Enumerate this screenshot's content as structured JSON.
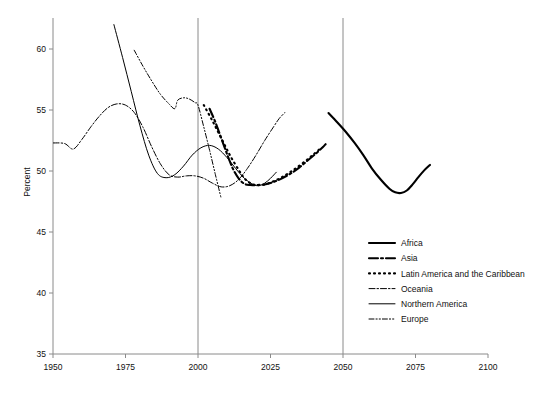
{
  "chart_data": {
    "type": "line",
    "title": "",
    "subtitle": "",
    "xlabel": "",
    "ylabel": "Percent",
    "xlim": [
      1950,
      2100
    ],
    "ylim": [
      35,
      62
    ],
    "grid": false,
    "legend_position": "inside-bottom-right",
    "x_ticks": [
      1950,
      1975,
      2000,
      2025,
      2050,
      2075,
      2100
    ],
    "y_ticks": [
      35,
      40,
      45,
      50,
      55,
      60
    ],
    "reference_lines": [
      {
        "name": "year-2000-line",
        "x": 2000
      },
      {
        "name": "year-2050-line",
        "x": 2050
      }
    ],
    "annotations": [],
    "series": [
      {
        "name": "Africa",
        "style": "thick-solid",
        "stroke_width": 2.1,
        "dash": "none",
        "color": "#000000",
        "points": [
          [
            2045,
            54.75
          ],
          [
            2048,
            54.0
          ],
          [
            2051,
            53.2
          ],
          [
            2054,
            52.3
          ],
          [
            2057,
            51.3
          ],
          [
            2060,
            50.2
          ],
          [
            2063,
            49.3
          ],
          [
            2066,
            48.55
          ],
          [
            2068,
            48.25
          ],
          [
            2070,
            48.2
          ],
          [
            2072,
            48.4
          ],
          [
            2074,
            48.9
          ],
          [
            2076,
            49.5
          ],
          [
            2078,
            50.05
          ],
          [
            2080,
            50.5
          ]
        ]
      },
      {
        "name": "Asia",
        "style": "thick-dash-dot",
        "stroke_width": 2.1,
        "dash": "9 3 2 3",
        "color": "#000000",
        "points": [
          [
            2004,
            55.1
          ],
          [
            2006,
            54.0
          ],
          [
            2008,
            52.7
          ],
          [
            2010,
            51.4
          ],
          [
            2012,
            50.2
          ],
          [
            2014,
            49.4
          ],
          [
            2016,
            48.95
          ],
          [
            2018,
            48.85
          ],
          [
            2020,
            48.85
          ],
          [
            2023,
            48.9
          ],
          [
            2026,
            49.1
          ],
          [
            2029,
            49.4
          ],
          [
            2032,
            49.8
          ],
          [
            2035,
            50.3
          ],
          [
            2038,
            50.9
          ],
          [
            2041,
            51.5
          ],
          [
            2043,
            51.95
          ],
          [
            2044,
            52.2
          ]
        ]
      },
      {
        "name": "Latin America and the Caribbean",
        "style": "thick-dotted",
        "stroke_width": 2.1,
        "dash": "1 4",
        "color": "#000000",
        "points": [
          [
            2002,
            55.4
          ],
          [
            2005,
            54.1
          ],
          [
            2008,
            52.7
          ],
          [
            2011,
            51.3
          ],
          [
            2014,
            50.1
          ],
          [
            2016,
            49.4
          ],
          [
            2018,
            49.0
          ],
          [
            2020,
            48.85
          ],
          [
            2023,
            48.9
          ],
          [
            2026,
            49.15
          ],
          [
            2029,
            49.5
          ],
          [
            2032,
            49.95
          ],
          [
            2035,
            50.45
          ],
          [
            2038,
            51.0
          ],
          [
            2040,
            51.4
          ],
          [
            2042,
            51.8
          ]
        ]
      },
      {
        "name": "Oceania",
        "style": "thin-dash-dot",
        "stroke_width": 1,
        "dash": "6 2 1.5 2",
        "color": "#000000",
        "points": [
          [
            1950,
            52.3
          ],
          [
            1954,
            52.25
          ],
          [
            1957,
            51.8
          ],
          [
            1960,
            52.6
          ],
          [
            1963,
            53.6
          ],
          [
            1966,
            54.5
          ],
          [
            1969,
            55.2
          ],
          [
            1972,
            55.5
          ],
          [
            1975,
            55.4
          ],
          [
            1978,
            54.8
          ],
          [
            1981,
            53.6
          ],
          [
            1984,
            52.0
          ],
          [
            1987,
            50.6
          ],
          [
            1990,
            49.7
          ],
          [
            1993,
            49.5
          ],
          [
            1996,
            49.6
          ],
          [
            1999,
            49.6
          ],
          [
            2002,
            49.4
          ],
          [
            2005,
            49.0
          ],
          [
            2008,
            48.7
          ],
          [
            2011,
            48.8
          ],
          [
            2014,
            49.3
          ],
          [
            2017,
            50.2
          ],
          [
            2020,
            51.3
          ],
          [
            2023,
            52.5
          ],
          [
            2026,
            53.6
          ],
          [
            2028,
            54.3
          ],
          [
            2030,
            54.8
          ]
        ]
      },
      {
        "name": "Northern America",
        "style": "thin-solid",
        "stroke_width": 1,
        "dash": "none",
        "color": "#000000",
        "points": [
          [
            1971,
            62.0
          ],
          [
            1974,
            59.3
          ],
          [
            1977,
            56.5
          ],
          [
            1980,
            53.7
          ],
          [
            1983,
            51.3
          ],
          [
            1986,
            49.8
          ],
          [
            1989,
            49.45
          ],
          [
            1992,
            49.7
          ],
          [
            1995,
            50.4
          ],
          [
            1998,
            51.3
          ],
          [
            2001,
            51.9
          ],
          [
            2004,
            52.1
          ],
          [
            2007,
            51.8
          ],
          [
            2010,
            51.1
          ],
          [
            2013,
            50.2
          ],
          [
            2016,
            49.4
          ],
          [
            2019,
            48.9
          ],
          [
            2021,
            48.8
          ],
          [
            2023,
            49.0
          ],
          [
            2025,
            49.4
          ],
          [
            2027,
            49.9
          ]
        ]
      },
      {
        "name": "Europe",
        "style": "thin-dash-dot-dot",
        "stroke_width": 1,
        "dash": "5 2 1.2 2 1.2 2",
        "color": "#000000",
        "points": [
          [
            1978,
            59.9
          ],
          [
            1981,
            58.6
          ],
          [
            1984,
            57.4
          ],
          [
            1987,
            56.3
          ],
          [
            1990,
            55.5
          ],
          [
            1992,
            55.1
          ],
          [
            1993,
            55.8
          ],
          [
            1995,
            56.0
          ],
          [
            1997,
            55.9
          ],
          [
            1999,
            55.6
          ],
          [
            2000,
            55.4
          ],
          [
            2002,
            53.6
          ],
          [
            2004,
            51.7
          ],
          [
            2006,
            49.7
          ],
          [
            2008,
            47.75
          ]
        ]
      }
    ],
    "legend": [
      {
        "label": "Africa",
        "style": "thick-solid"
      },
      {
        "label": "Asia",
        "style": "thick-dash-dot"
      },
      {
        "label": "Latin America and the Caribbean",
        "style": "thick-dotted"
      },
      {
        "label": "Oceania",
        "style": "thin-dash-dot"
      },
      {
        "label": "Northern America",
        "style": "thin-solid"
      },
      {
        "label": "Europe",
        "style": "thin-dash-dot-dot"
      }
    ]
  }
}
